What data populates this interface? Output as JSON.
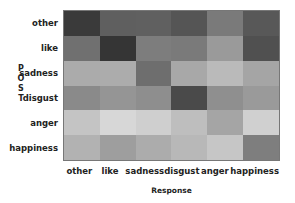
{
  "chart_data": {
    "type": "heatmap",
    "title": "",
    "xlabel": "Response",
    "ylabel": "POST",
    "x_categories": [
      "other",
      "like",
      "sadness",
      "disgust",
      "anger",
      "happiness"
    ],
    "y_categories": [
      "other",
      "like",
      "sadness",
      "disgust",
      "anger",
      "happiness"
    ],
    "colormap": "grayscale (darker = higher)",
    "values": [
      [
        0.77,
        0.63,
        0.62,
        0.67,
        0.52,
        0.65
      ],
      [
        0.56,
        0.79,
        0.51,
        0.52,
        0.4,
        0.69
      ],
      [
        0.33,
        0.33,
        0.57,
        0.34,
        0.27,
        0.35
      ],
      [
        0.46,
        0.42,
        0.44,
        0.71,
        0.44,
        0.4
      ],
      [
        0.23,
        0.16,
        0.19,
        0.25,
        0.35,
        0.18
      ],
      [
        0.3,
        0.38,
        0.33,
        0.28,
        0.22,
        0.51
      ]
    ],
    "cell_colors": [
      [
        "#3a3a3a",
        "#5f5f5f",
        "#606060",
        "#555555",
        "#7a7a7a",
        "#585858"
      ],
      [
        "#707070",
        "#353535",
        "#7d7d7d",
        "#7a7a7a",
        "#9a9a9a",
        "#505050"
      ],
      [
        "#ababab",
        "#acacac",
        "#6e6e6e",
        "#a8a8a8",
        "#bababa",
        "#a5a5a5"
      ],
      [
        "#8a8a8a",
        "#959595",
        "#8e8e8e",
        "#4a4a4a",
        "#8f8f8f",
        "#9a9a9a"
      ],
      [
        "#c4c4c4",
        "#d7d7d7",
        "#cfcfcf",
        "#bebebe",
        "#a5a5a5",
        "#d0d0d0"
      ],
      [
        "#b2b2b2",
        "#9e9e9e",
        "#acacac",
        "#b8b8b8",
        "#c6c6c6",
        "#7e7e7e"
      ]
    ],
    "legend": null,
    "grid": false
  }
}
